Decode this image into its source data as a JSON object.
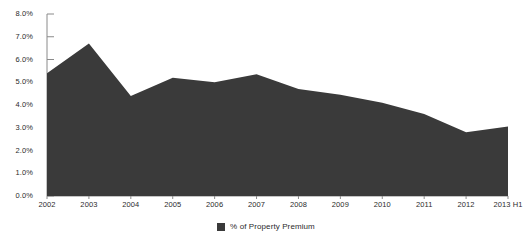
{
  "chart_data": {
    "type": "area",
    "title": "",
    "subtitle": "",
    "xlabel": "",
    "ylabel": "",
    "categories": [
      "2002",
      "2003",
      "2004",
      "2005",
      "2006",
      "2007",
      "2008",
      "2009",
      "2010",
      "2011",
      "2012",
      "2013 H1"
    ],
    "series": [
      {
        "name": "% of Property Premium",
        "color": "#3a3a3a",
        "values": [
          5.4,
          6.7,
          4.4,
          5.2,
          5.0,
          5.35,
          4.7,
          4.45,
          4.1,
          3.6,
          2.8,
          3.05
        ]
      }
    ],
    "ylim": [
      0,
      8
    ],
    "ytick_values": [
      0,
      1,
      2,
      3,
      4,
      5,
      6,
      7,
      8
    ],
    "ytick_labels": [
      "0.0%",
      "1.0%",
      "2.0%",
      "3.0%",
      "4.0%",
      "5.0%",
      "6.0%",
      "7.0%",
      "8.0%"
    ],
    "grid": false,
    "legend_position": "bottom",
    "legend": [
      {
        "label": "% of Property Premium",
        "color": "#3a3a3a",
        "swatch": "square-swatch"
      }
    ],
    "axis_color": "#8a8a8a",
    "text_color": "#2b2b2b",
    "background_color": "#ffffff"
  }
}
